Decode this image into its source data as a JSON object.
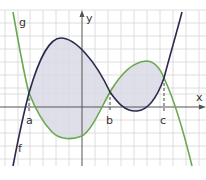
{
  "diagram": {
    "title": "",
    "curves": [
      {
        "name": "f",
        "label": "f",
        "color": "#2a2a4e"
      },
      {
        "name": "g",
        "label": "g",
        "color": "#6aa84f"
      }
    ],
    "axes": {
      "x_label": "x",
      "y_label": "y"
    },
    "points": [
      {
        "label": "a"
      },
      {
        "label": "b"
      },
      {
        "label": "c"
      }
    ],
    "shade_color": "#d9d9e6"
  }
}
